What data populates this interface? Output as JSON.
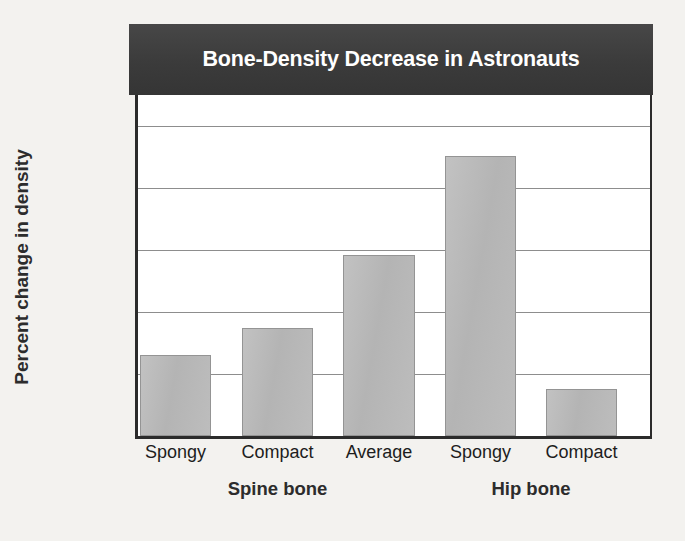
{
  "chart_data": {
    "type": "bar",
    "title": "Bone-Density Decrease in Astronauts",
    "xlabel": "",
    "ylabel": "Percent change in density",
    "categories": [
      "Spongy",
      "Compact",
      "Average",
      "Spongy",
      "Compact"
    ],
    "values": [
      0.65,
      0.87,
      1.46,
      2.26,
      0.38
    ],
    "groups": [
      {
        "label": "Spine bone",
        "categories": [
          "Spongy",
          "Compact",
          "Average"
        ]
      },
      {
        "label": "Hip bone",
        "categories": [
          "Spongy",
          "Compact"
        ]
      }
    ],
    "group_labels": [
      "Spine bone",
      "Hip bone"
    ],
    "ylim": [
      0.0,
      2.75
    ],
    "yticks": [
      0.0,
      0.5,
      1.0,
      1.5,
      2.0,
      2.5
    ],
    "ytick_labels": [
      "0.0",
      "0.5",
      "1.0",
      "1.5",
      "2.0",
      "2.5"
    ],
    "grid": true,
    "grid_axis": "y",
    "legend": false,
    "bar_color": "#b6b6b6",
    "bar_border_color": "#949494",
    "title_background": "#3f3f3f",
    "title_color": "#ffffff",
    "plot_background": "#ffffff",
    "figure_background": "#f3f2ef",
    "axis_color": "#2b2b2b",
    "gridline_color": "#8d8d8d"
  }
}
